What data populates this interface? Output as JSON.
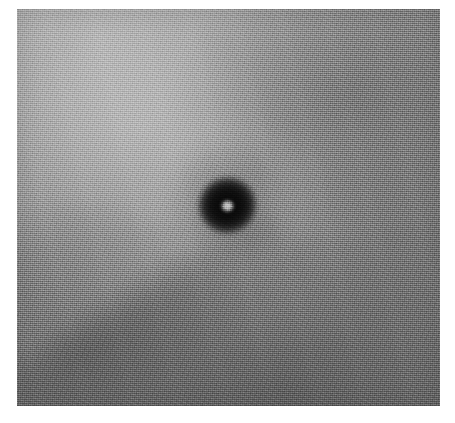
{
  "image": {
    "title": "Grayscale close-up photograph",
    "subject": "skin surface with central dark circular lesion",
    "modality": "grayscale photograph",
    "canvas": {
      "width": 455,
      "height": 423,
      "background_color": "#ffffff"
    },
    "plate": {
      "left": 17,
      "top": 9,
      "width": 423,
      "height": 397,
      "border_color": "#ffffff"
    },
    "tones": {
      "lightest_corner": "top-left",
      "lightest_value": "#b4b4b4",
      "darkest_corner": "bottom-right",
      "darkest_value": "#6a6a6a",
      "mid_value": "#8c8c8c",
      "texture": "fine film grain / dither noise"
    },
    "feature": {
      "name": "central-lesion",
      "shape": "ellipse",
      "center_x": 227,
      "center_y": 205,
      "width": 63,
      "height": 61,
      "fill_color": "#0a0a0a",
      "halo": "soft dark gradient fading into background",
      "highlight": {
        "name": "specular-highlight",
        "center_x": 227,
        "center_y": 206,
        "diameter": 14,
        "color": "#cfcfcf"
      }
    },
    "annotations": [],
    "labels": [],
    "scale_bar": null
  }
}
